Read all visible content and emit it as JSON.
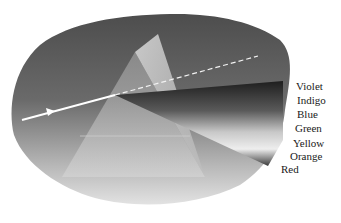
{
  "diagram": {
    "spectrum_labels": [
      "Violet",
      "Indigo",
      "Blue",
      "Green",
      "Yellow",
      "Orange",
      "Red"
    ]
  }
}
